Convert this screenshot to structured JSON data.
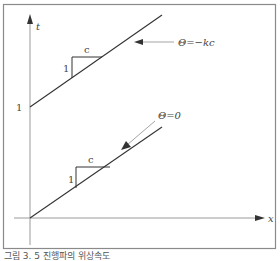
{
  "figure": {
    "axes": {
      "x_label": "x",
      "y_label": "t",
      "y_tick_label": "1"
    },
    "upper_line": {
      "label": "Θ=−kc",
      "slope_triangle": {
        "run_label": "c",
        "rise_label": "1"
      }
    },
    "lower_line": {
      "label": "Θ=0",
      "slope_triangle": {
        "run_label": "c",
        "rise_label": "1"
      }
    },
    "colors": {
      "frame": "#8a8a8a",
      "axis": "#9a9a9a",
      "line": "#333333",
      "text": "#444444"
    }
  },
  "caption": "그림 3. 5 진행파의 위상속도"
}
